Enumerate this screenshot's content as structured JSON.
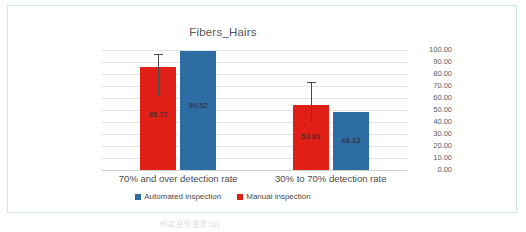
{
  "frame": {
    "border_color": "#cfe4ec",
    "background": "#ffffff"
  },
  "caption": "비교 분석 결과 11)",
  "chart_data": {
    "type": "bar",
    "title": "Fibers_Hairs",
    "xlabel": "",
    "ylabel": "",
    "ylim": [
      0,
      100
    ],
    "ytick_step": 10,
    "grid": true,
    "y_axis_position": "right",
    "legend_position": "bottom",
    "categories": [
      "70% and over detection rate",
      "30% to 70% detection rate"
    ],
    "tick_labels": [
      "100.00",
      "90.00",
      "80.00",
      "70.00",
      "60.00",
      "50.00",
      "40.00",
      "30.00",
      "20.00",
      "10.00",
      "0.00"
    ],
    "series": [
      {
        "name": "Manual inspection",
        "color": "#E02017",
        "values": [
          85.72,
          53.89
        ],
        "labels": [
          "85.72",
          "53.89"
        ],
        "error_high": [
          96.5,
          73.0
        ]
      },
      {
        "name": "Automated inspection",
        "color": "#2E6DA4",
        "values": [
          99.52,
          48.33
        ],
        "labels": [
          "99.52",
          "48.33"
        ],
        "error_high": [
          null,
          null
        ]
      }
    ],
    "legend": [
      {
        "label": "Automated inspection",
        "color": "#2E6DA4"
      },
      {
        "label": "Manual inspection",
        "color": "#E02017"
      }
    ]
  }
}
